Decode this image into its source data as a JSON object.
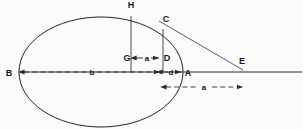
{
  "figure": {
    "background_color": "#fbfbfb",
    "ink_color": "#23232a",
    "width": 303,
    "height": 129
  },
  "points": [
    {
      "id": "B",
      "label": "B",
      "x": 20,
      "y": 72,
      "role": "left-vertex-major-axis"
    },
    {
      "id": "H",
      "label": "H",
      "x": 131,
      "y": 10,
      "role": "upper-curve-point-over-G"
    },
    {
      "id": "C",
      "label": "C",
      "x": 163,
      "y": 25,
      "role": "upper-curve-point-over-D"
    },
    {
      "id": "G",
      "label": "G",
      "x": 131,
      "y": 58,
      "role": "axis-point-below-H"
    },
    {
      "id": "D",
      "label": "D",
      "x": 163,
      "y": 58,
      "role": "axis-point-below-C"
    },
    {
      "id": "A",
      "label": "A",
      "x": 183,
      "y": 72,
      "role": "right-vertex-major-axis"
    },
    {
      "id": "E",
      "label": "E",
      "x": 242,
      "y": 68,
      "role": "tangent-intersection-on-axis"
    }
  ],
  "dimensions": [
    {
      "id": "dim-a-upper",
      "label": "a",
      "from": "G",
      "to": "D",
      "x1": 134,
      "x2": 160,
      "y": 58,
      "style": "dashed-double-arrow",
      "label_x": 147,
      "label_y": 61
    },
    {
      "id": "dim-b",
      "label": "b",
      "from": "B",
      "to": "d-left",
      "x1": 24,
      "x2": 161,
      "y": 72,
      "style": "dashed-double-arrow",
      "label_x": 92,
      "label_y": 75
    },
    {
      "id": "dim-d",
      "label": "d",
      "from": "D",
      "to": "A",
      "x1": 161,
      "x2": 181,
      "y": 72,
      "style": "dashed-double-arrow",
      "label_x": 171,
      "label_y": 75
    },
    {
      "id": "dim-a-lower",
      "label": "a",
      "from": "D-drop",
      "to": "E-drop",
      "x1": 164,
      "x2": 243,
      "y": 87,
      "style": "dashed-double-arrow",
      "label_x": 204,
      "label_y": 90
    }
  ],
  "ellipse": {
    "center_x": 101,
    "center_y": 72,
    "semi_major": 82,
    "semi_minor": 55
  },
  "lines": [
    {
      "id": "major-axis",
      "kind": "axis",
      "x1": 20,
      "y1": 72,
      "x2": 300,
      "y2": 72
    },
    {
      "id": "ordinate-HG",
      "kind": "ordinate",
      "x1": 131,
      "y1": 16,
      "x2": 131,
      "y2": 72
    },
    {
      "id": "ordinate-CD",
      "kind": "ordinate",
      "x1": 163,
      "y1": 29,
      "x2": 163,
      "y2": 72
    },
    {
      "id": "tangent-CE",
      "kind": "tangent",
      "x1": 160,
      "y1": 22,
      "x2": 242,
      "y2": 69
    }
  ],
  "labels_all": [
    "B",
    "H",
    "C",
    "G",
    "D",
    "A",
    "E",
    "a",
    "b",
    "d",
    "a"
  ]
}
